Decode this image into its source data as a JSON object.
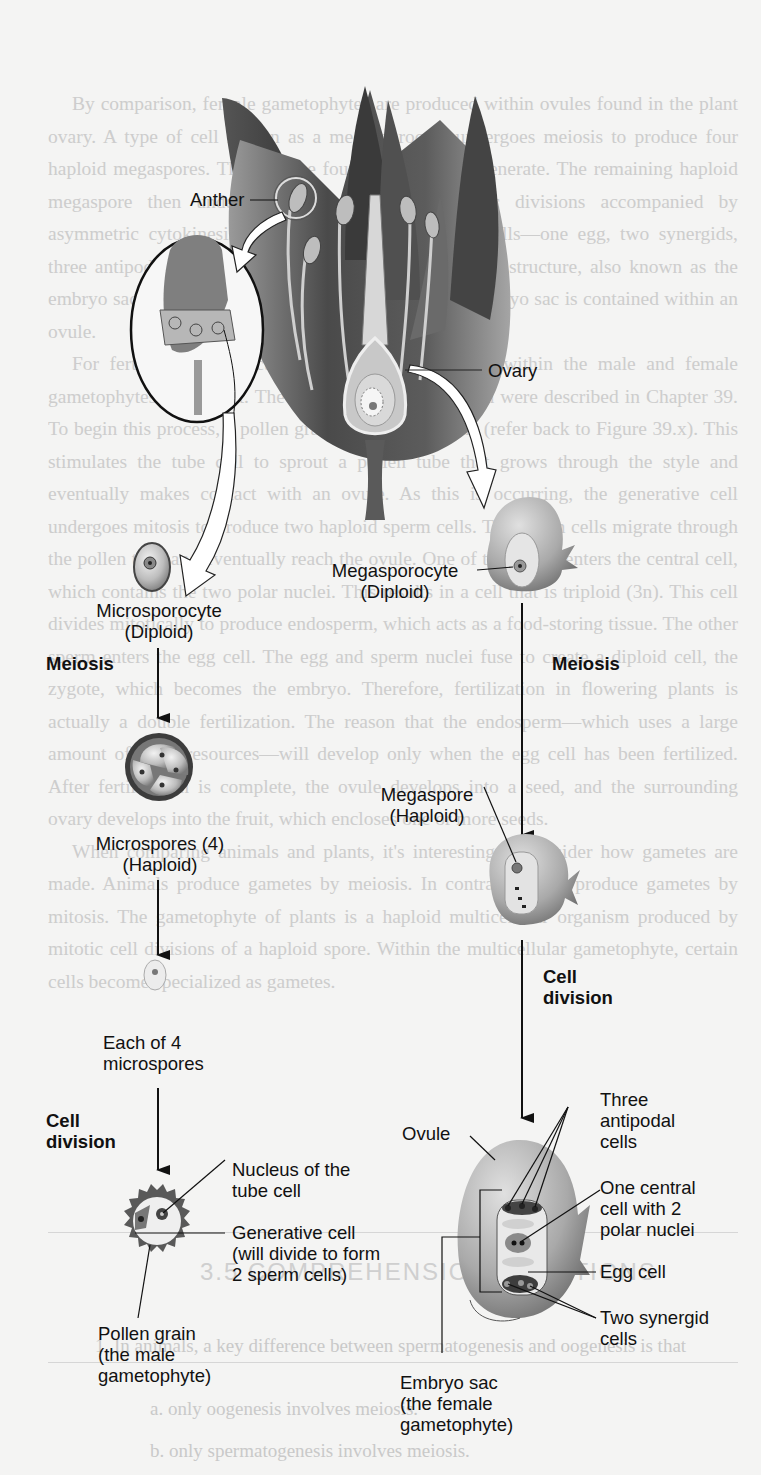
{
  "figure": {
    "labels": {
      "anther": "Anther",
      "ovary": "Ovary",
      "microsporocyte": "Microsporocyte\n(Diploid)",
      "megasporocyte": "Megasporocyte\n(Diploid)",
      "meiosis_left": "Meiosis",
      "meiosis_right": "Meiosis",
      "microspores": "Microspores (4)\n(Haploid)",
      "megaspore": "Megaspore\n(Haploid)",
      "each_microspore": "Each of 4\nmicrospores",
      "cell_division_left": "Cell\ndivision",
      "cell_division_right": "Cell\ndivision",
      "nucleus_tube_cell": "Nucleus of the\ntube cell",
      "generative_cell": "Generative cell\n(will divide to form\n2 sperm cells)",
      "pollen_grain": "Pollen grain\n(the male\ngametophyte)",
      "ovule": "Ovule",
      "three_antipodal": "Three\nantipodal\ncells",
      "central_cell": "One central\ncell with 2\npolar nuclei",
      "egg_cell": "Egg cell",
      "two_synergid": "Two synergid\ncells",
      "embryo_sac": "Embryo sac\n(the female\ngametophyte)"
    }
  },
  "bleed_through": {
    "paragraphs": [
      "By comparison, female gametophytes are produced within ovules found in the plant ovary. A type of cell known as a megasporocyte undergoes meiosis to produce four haploid megaspores. Three of the four megaspores degenerate. The remaining haploid megaspore then undergoes three rounds of mitotic divisions accompanied by asymmetric cytokinesis to produce seven individual cells—one egg, two synergids, three antipodals, and one central cell. This seven-celled structure, also known as the embryo sac, is the mature female gametophyte. Each embryo sac is contained within an ovule.",
      "For fertilization to occur, the sperm and egg cell within the male and female gametophytes must meet. The steps of plant fertilization were described in Chapter 39. To begin this process, a pollen grain lands on a stigma (refer back to Figure 39.x). This stimulates the tube cell to sprout a pollen tube that grows through the style and eventually makes contact with an ovule. As this is occurring, the generative cell undergoes mitosis to produce two haploid sperm cells. The sperm cells migrate through the pollen tube and eventually reach the ovule. One of the sperm enters the central cell, which contains the two polar nuclei. This results in a cell that is triploid (3n). This cell divides mitotically to produce endosperm, which acts as a food-storing tissue. The other sperm enters the egg cell. The egg and sperm nuclei fuse to create a diploid cell, the zygote, which becomes the embryo. Therefore, fertilization in flowering plants is actually a double fertilization. The reason that the endosperm—which uses a large amount of plant resources—will develop only when the egg cell has been fertilized. After fertilization is complete, the ovule develops into a seed, and the surrounding ovary develops into the fruit, which encloses one or more seeds.",
      "When comparing animals and plants, it's interesting to consider how gametes are made. Animals produce gametes by meiosis. In contrast, plants produce gametes by mitosis. The gametophyte of plants is a haploid multicellular organism produced by mitotic cell divisions of a haploid spore. Within the multicellular gametophyte, certain cells become specialized as gametes."
    ],
    "heading": "3.5 COMPREHENSION QUESTIONS",
    "questions": [
      "1. In animals, a key difference between spermatogenesis and oogenesis is that",
      "a. only oogenesis involves meiosis.",
      "b. only spermatogenesis involves meiosis."
    ]
  }
}
